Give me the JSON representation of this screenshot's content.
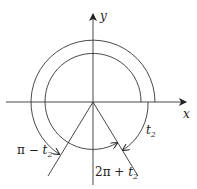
{
  "diagram": {
    "type": "polar-angle-diagram",
    "axes": {
      "x_label": "x",
      "y_label": "y"
    },
    "labels": {
      "t2": {
        "base": "t",
        "sub": "2"
      },
      "pi_minus_t2": {
        "prefix": "π − ",
        "base": "t",
        "sub": "2"
      },
      "two_pi_plus_t2": {
        "prefix": "2π + ",
        "base": "t",
        "sub": "2"
      }
    },
    "colors": {
      "stroke": "#333333",
      "text": "#222222",
      "background": "#ffffff"
    }
  }
}
